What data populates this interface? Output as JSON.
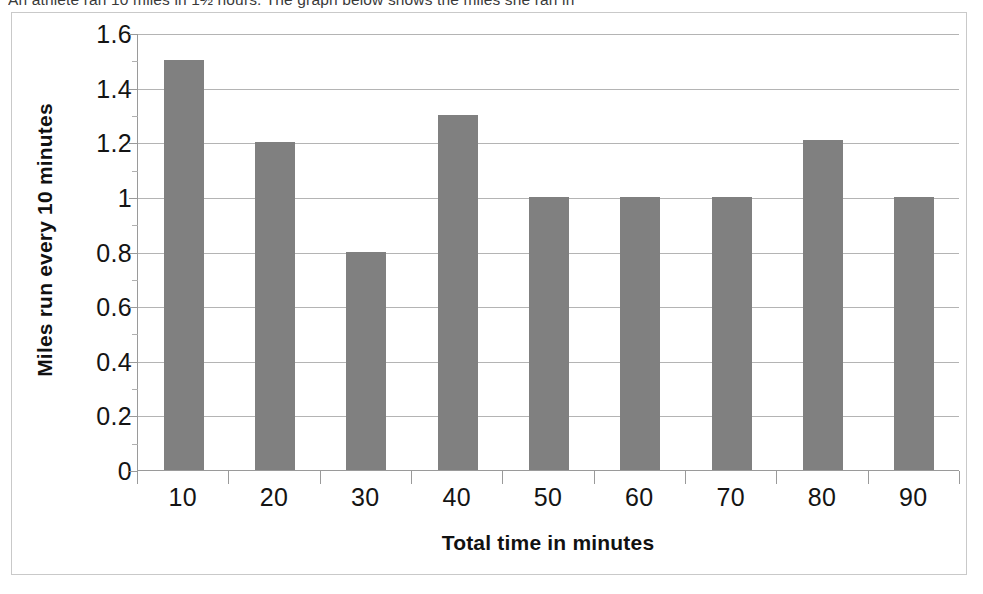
{
  "document": {
    "header_text": "An athlete ran 10 miles in 1½ hours. The graph below shows the miles she ran in"
  },
  "chart_data": {
    "type": "bar",
    "title": "",
    "categories": [
      "10",
      "20",
      "30",
      "40",
      "50",
      "60",
      "70",
      "80",
      "90"
    ],
    "values": [
      1.5,
      1.2,
      0.8,
      1.3,
      1.0,
      1.0,
      1.0,
      1.21,
      1.0
    ],
    "xlabel": "Total time in minutes",
    "ylabel": "Miles run every 10 minutes",
    "ylim": [
      0,
      1.6
    ],
    "ytick_labels": [
      "0",
      "0.2",
      "0.4",
      "0.6",
      "0.8",
      "1",
      "1.2",
      "1.4",
      "1.6"
    ],
    "ytick_values": [
      0,
      0.2,
      0.4,
      0.6,
      0.8,
      1.0,
      1.2,
      1.4,
      1.6
    ],
    "grid": true,
    "legend": false,
    "bar_color": "#808080",
    "gridline_color": "#b4b4b4",
    "axis_color": "#9a9a9a",
    "border_color": "#c9c9c9"
  }
}
